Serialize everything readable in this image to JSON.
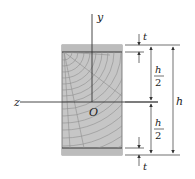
{
  "figure": {
    "axes": {
      "y_label": "y",
      "z_label": "z",
      "origin_label": "O"
    },
    "dimensions": {
      "top_thickness_label": "t",
      "bottom_thickness_label": "t",
      "upper_half": {
        "numerator": "h",
        "denominator": "2"
      },
      "lower_half": {
        "numerator": "h",
        "denominator": "2"
      },
      "total_height_label": "h"
    },
    "colors": {
      "wood_fill": "#c4c4c4",
      "flange_fill": "#bdbdbd",
      "grain_line": "#8e8e8e",
      "line": "#333333"
    }
  }
}
